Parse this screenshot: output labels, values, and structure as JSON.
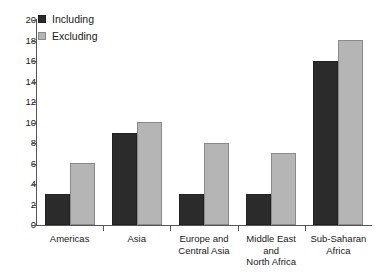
{
  "chart_data": {
    "type": "bar",
    "title": "",
    "xlabel": "",
    "ylabel": "",
    "ylim": [
      0,
      20
    ],
    "ytick_step": 2,
    "grid": false,
    "legend_position": "top-left",
    "categories": [
      "Americas",
      "Asia",
      "Europe and Central Asia",
      "Middle East and North Africa",
      "Sub-Saharan Africa"
    ],
    "ytick_labels": [
      "0",
      "2",
      "4",
      "6",
      "8",
      "10",
      "12",
      "14",
      "16",
      "18",
      "20"
    ],
    "series": [
      {
        "name": "Including",
        "color": "#2b2b2b",
        "values": [
          3,
          9,
          3,
          3,
          16
        ]
      },
      {
        "name": "Excluding",
        "color": "#b5b5b5",
        "values": [
          6,
          10,
          8,
          7,
          18
        ]
      }
    ]
  },
  "legend": {
    "items": [
      {
        "label": "Including",
        "swatch": "including"
      },
      {
        "label": "Excluding",
        "swatch": "excluding"
      }
    ]
  },
  "category_lines": [
    [
      "Americas"
    ],
    [
      "Asia"
    ],
    [
      "Europe and",
      "Central Asia"
    ],
    [
      "Middle East",
      "and",
      "North Africa"
    ],
    [
      "Sub-Saharan",
      "Africa"
    ]
  ]
}
